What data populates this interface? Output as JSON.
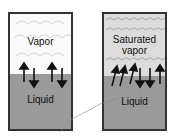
{
  "left": {
    "vapor_label": "Vapor",
    "liquid_label": "Liquid"
  },
  "right": {
    "vapor_label_line1": "Saturated",
    "vapor_label_line2": "vapor",
    "liquid_label": "Liquid"
  },
  "colors": {
    "liquid": "#9a9a9a",
    "border": "#333333",
    "vapor_dense": "#c8c8c8"
  }
}
